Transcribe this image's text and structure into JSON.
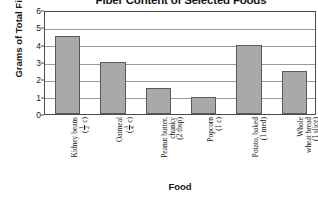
{
  "chart_data": {
    "type": "bar",
    "title": "Fiber Content of Selected Foods",
    "xlabel": "Food",
    "ylabel": "Grams of Total Fiber",
    "ylim": [
      0,
      6
    ],
    "yticks": [
      "0",
      "1",
      "2",
      "3",
      "4",
      "5",
      "6"
    ],
    "grid": true,
    "legend": "none",
    "bar_color": "#a9a9a9",
    "bar_edge_color": "#5a5a5a",
    "categories": [
      "Kidney beans (1/2 c)",
      "Oatmeal (3/4 c)",
      "Peanut butter, chunky (2 tbsp)",
      "Popcorn (1 c)",
      "Potato, baked (1 med)",
      "Whole wheat bread (1 slice)"
    ],
    "values": [
      4.5,
      3.0,
      1.5,
      1.0,
      4.0,
      2.5
    ],
    "tick_labels": [
      {
        "name": "Kidney beans",
        "amount_num": "1",
        "amount_den": "2",
        "amount_unit": "c",
        "amount_plain": ""
      },
      {
        "name": "Oatmeal",
        "amount_num": "3",
        "amount_den": "4",
        "amount_unit": "c",
        "amount_plain": ""
      },
      {
        "name": "Peanut butter,",
        "name2": "chunky",
        "amount_plain": "(2 tbsp)"
      },
      {
        "name": "Popcorn",
        "amount_plain": "(1 c)"
      },
      {
        "name": "Potato, baked",
        "amount_plain": "(1 med)"
      },
      {
        "name": "Whole",
        "name2": "wheat bread",
        "amount_plain": "(1 slice)"
      }
    ]
  }
}
